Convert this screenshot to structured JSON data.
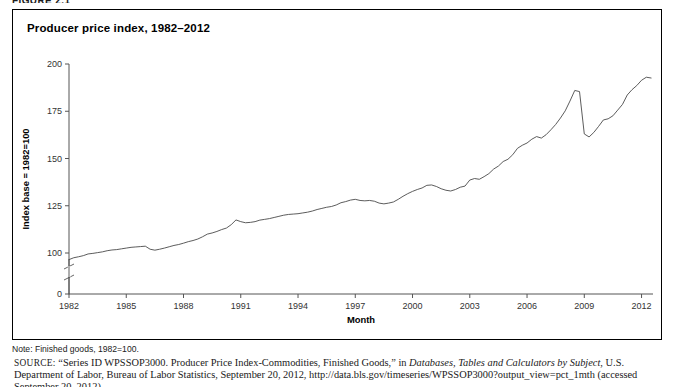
{
  "figure_number": "FIGURE 2.1",
  "figure": {
    "title": "Producer price index, 1982–2012",
    "note": "Note: Finished goods, 1982=100."
  },
  "source": {
    "label": "SOURCE:",
    "part1": "“Series ID WPSSOP3000. Producer Price Index-Commodities, Finished Goods,” in ",
    "italic": "Databases, Tables and Calculators by Subject",
    "part2": ", U.S. Department of Labor, Bureau of Labor Statistics, September 20, 2012, http://data.bls.gov/timeseries/WPSSOP3000?output_view=pct_1mth (accessed September 20, 2012)"
  },
  "colors": {
    "line": "#4a4a4a",
    "axis": "#555555",
    "border": "#000000",
    "background": "#ffffff"
  },
  "chart_data": {
    "type": "line",
    "title": "Producer price index, 1982–2012",
    "xlabel": "Month",
    "ylabel": "Index base = 1982=100",
    "xlim": [
      1982,
      2012.6
    ],
    "ylim": [
      0,
      200
    ],
    "yticks": [
      0,
      100,
      125,
      150,
      175,
      200
    ],
    "ytick_labels": [
      "0",
      "100",
      "125",
      "150",
      "175",
      "200"
    ],
    "y_axis_break": {
      "between": [
        0,
        100
      ],
      "style": "zigzag"
    },
    "xticks": [
      1982,
      1985,
      1988,
      1991,
      1994,
      1997,
      2000,
      2003,
      2006,
      2009,
      2012
    ],
    "xtick_labels": [
      "1982",
      "1985",
      "1988",
      "1991",
      "1994",
      "1997",
      "2000",
      "2003",
      "2006",
      "2009",
      "2012"
    ],
    "grid": false,
    "legend": "none",
    "series": [
      {
        "name": "Producer price index (finished goods)",
        "x": [
          1982.0,
          1982.25,
          1982.5,
          1982.75,
          1983.0,
          1983.25,
          1983.5,
          1983.75,
          1984.0,
          1984.25,
          1984.5,
          1984.75,
          1985.0,
          1985.25,
          1985.5,
          1985.75,
          1986.0,
          1986.25,
          1986.5,
          1986.75,
          1987.0,
          1987.25,
          1987.5,
          1987.75,
          1988.0,
          1988.25,
          1988.5,
          1988.75,
          1989.0,
          1989.25,
          1989.5,
          1989.75,
          1990.0,
          1990.25,
          1990.5,
          1990.75,
          1991.0,
          1991.25,
          1991.5,
          1991.75,
          1992.0,
          1992.25,
          1992.5,
          1992.75,
          1993.0,
          1993.25,
          1993.5,
          1993.75,
          1994.0,
          1994.25,
          1994.5,
          1994.75,
          1995.0,
          1995.25,
          1995.5,
          1995.75,
          1996.0,
          1996.25,
          1996.5,
          1996.75,
          1997.0,
          1997.25,
          1997.5,
          1997.75,
          1998.0,
          1998.25,
          1998.5,
          1998.75,
          1999.0,
          1999.25,
          1999.5,
          1999.75,
          2000.0,
          2000.25,
          2000.5,
          2000.75,
          2001.0,
          2001.25,
          2001.5,
          2001.75,
          2002.0,
          2002.25,
          2002.5,
          2002.75,
          2003.0,
          2003.25,
          2003.5,
          2003.75,
          2004.0,
          2004.25,
          2004.5,
          2004.75,
          2005.0,
          2005.25,
          2005.5,
          2005.75,
          2006.0,
          2006.25,
          2006.5,
          2006.75,
          2007.0,
          2007.25,
          2007.5,
          2007.75,
          2008.0,
          2008.25,
          2008.5,
          2008.75,
          2009.0,
          2009.25,
          2009.5,
          2009.75,
          2010.0,
          2010.25,
          2010.5,
          2010.75,
          2011.0,
          2011.25,
          2011.5,
          2011.75,
          2012.0,
          2012.25,
          2012.5
        ],
        "y": [
          96.5,
          97.5,
          98.0,
          98.6,
          99.5,
          99.8,
          100.2,
          100.6,
          101.2,
          101.6,
          101.8,
          102.2,
          102.6,
          103.0,
          103.2,
          103.4,
          103.6,
          102.0,
          101.5,
          102.0,
          102.6,
          103.3,
          104.0,
          104.5,
          105.2,
          106.0,
          106.6,
          107.4,
          108.6,
          110.0,
          110.6,
          111.4,
          112.4,
          113.2,
          115.0,
          117.5,
          116.6,
          116.0,
          116.2,
          116.6,
          117.4,
          117.8,
          118.2,
          118.8,
          119.4,
          120.0,
          120.4,
          120.6,
          120.8,
          121.2,
          121.6,
          122.2,
          123.0,
          123.6,
          124.2,
          124.6,
          125.4,
          126.6,
          127.2,
          128.0,
          128.4,
          127.8,
          127.6,
          127.8,
          127.4,
          126.4,
          126.0,
          126.4,
          127.0,
          128.4,
          130.0,
          131.4,
          132.6,
          133.6,
          134.4,
          135.8,
          136.0,
          135.2,
          134.0,
          133.2,
          132.8,
          133.6,
          134.8,
          135.4,
          138.6,
          139.4,
          139.0,
          140.4,
          142.0,
          144.4,
          146.0,
          148.4,
          149.6,
          152.0,
          155.4,
          157.0,
          158.2,
          160.2,
          161.6,
          160.8,
          162.6,
          165.2,
          168.0,
          171.4,
          175.2,
          180.4,
          186.0,
          185.4,
          163.0,
          161.4,
          163.8,
          167.0,
          170.4,
          171.0,
          172.6,
          175.6,
          178.6,
          183.6,
          186.4,
          188.6,
          191.4,
          193.0,
          192.6
        ]
      }
    ]
  }
}
